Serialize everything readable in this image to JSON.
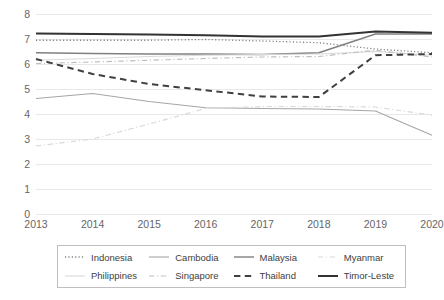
{
  "chart_data": {
    "type": "line",
    "title": "",
    "xlabel": "",
    "ylabel": "",
    "grid": true,
    "legend_position": "bottom",
    "categories": [
      "2013",
      "2014",
      "2015",
      "2016",
      "2017",
      "2018",
      "2019",
      "2020"
    ],
    "ylim": [
      0,
      8
    ],
    "y_ticks": [
      "0",
      "1",
      "2",
      "3",
      "4",
      "5",
      "6",
      "7",
      "8"
    ],
    "series": [
      {
        "name": "Indonesia",
        "style": "dotted",
        "color": "#808080",
        "width": 1.3,
        "values": [
          6.95,
          6.95,
          6.95,
          6.98,
          6.92,
          6.85,
          6.6,
          6.45
        ]
      },
      {
        "name": "Cambodia",
        "style": "solid",
        "color": "#a6a6a6",
        "width": 1.1,
        "values": [
          4.62,
          4.82,
          4.5,
          4.25,
          4.22,
          4.2,
          4.12,
          3.15
        ]
      },
      {
        "name": "Malaysia",
        "style": "solid",
        "color": "#808080",
        "width": 1.4,
        "values": [
          6.45,
          6.42,
          6.4,
          6.4,
          6.38,
          6.45,
          7.2,
          7.2
        ]
      },
      {
        "name": "Myanmar",
        "style": "dashdot",
        "color": "#d9d9d9",
        "width": 1.2,
        "values": [
          2.72,
          3.0,
          3.6,
          4.22,
          4.3,
          4.3,
          4.28,
          3.95
        ]
      },
      {
        "name": "Philippines",
        "style": "solid",
        "color": "#d9d9d9",
        "width": 1.1,
        "values": [
          6.15,
          6.22,
          6.3,
          6.35,
          6.38,
          6.4,
          6.5,
          6.35
        ]
      },
      {
        "name": "Singapore",
        "style": "dashdot",
        "color": "#bfbfbf",
        "width": 1.2,
        "values": [
          6.02,
          6.08,
          6.15,
          6.22,
          6.28,
          6.3,
          6.55,
          6.28
        ]
      },
      {
        "name": "Thailand",
        "style": "dashed",
        "color": "#404040",
        "width": 2.0,
        "values": [
          6.2,
          5.6,
          5.2,
          4.95,
          4.7,
          4.68,
          6.35,
          6.4
        ]
      },
      {
        "name": "Timor-Leste",
        "style": "solid",
        "color": "#333333",
        "width": 2.0,
        "values": [
          7.22,
          7.2,
          7.18,
          7.15,
          7.1,
          7.1,
          7.3,
          7.25
        ]
      }
    ]
  }
}
